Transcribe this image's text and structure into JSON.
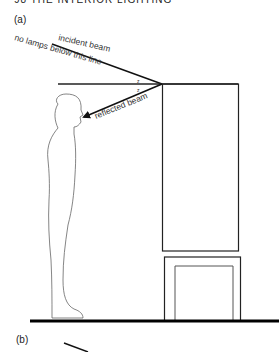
{
  "header": {
    "text": "98   THE INTERIOR LIGHTING"
  },
  "panels": [
    {
      "label": "(a)"
    },
    {
      "label": "(b)"
    }
  ],
  "annotations": {
    "incident_beam": "incident beam",
    "no_lamps": "no lamps below this line",
    "reflected_beam": "reflected beam",
    "angle_mark_1": "z",
    "angle_mark_2": "z"
  },
  "colors": {
    "line": "#111111",
    "figure_outline": "#555555",
    "text": "#333333",
    "background": "#ffffff"
  }
}
